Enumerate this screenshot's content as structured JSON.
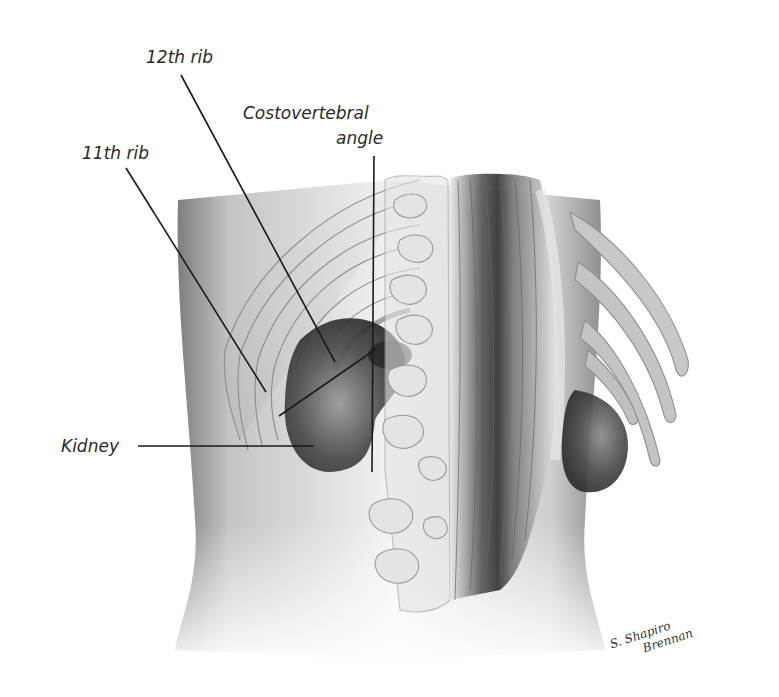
{
  "figure": {
    "labels": {
      "rib12": "12th rib",
      "cva_line1": "Costovertebral",
      "cva_line2": "angle",
      "rib11": "11th rib",
      "kidney": "Kidney"
    },
    "signature": {
      "line1": "S. Shapiro",
      "line2": "Brennan"
    },
    "colors": {
      "background": "#ffffff",
      "skin_shadow": "#9a9a9a",
      "skin_light": "#e6e6e6",
      "kidney": "#3a3a3a",
      "outline": "#888888",
      "leader_line": "#1a1a1a",
      "label_text": "#2a2a2a"
    }
  }
}
